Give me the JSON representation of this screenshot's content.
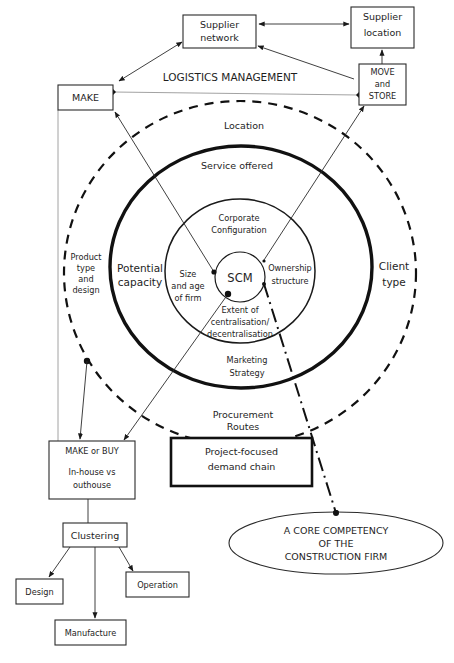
{
  "diagram": {
    "header_label": "LOGISTICS MANAGEMENT",
    "boxes": {
      "supplier_network": [
        "Supplier",
        "network"
      ],
      "supplier_location": [
        "Supplier",
        "location"
      ],
      "make": "MAKE",
      "move_and_store": [
        "MOVE",
        "and",
        "STORE"
      ],
      "make_or_buy": {
        "title": "MAKE or BUY",
        "lines": [
          "In-house vs",
          "outhouse"
        ]
      },
      "project_focused": [
        "Project-focused",
        "demand chain"
      ],
      "clustering": "Clustering",
      "design": "Design",
      "operation": "Operation",
      "manufacture": "Manufacture"
    },
    "rings": {
      "outer_dashed": {
        "top": "Location",
        "left": [
          "Product",
          "type",
          "and",
          "design"
        ],
        "right": [
          "Client",
          "type"
        ],
        "bottom": [
          "Procurement",
          "Routes"
        ]
      },
      "thick": {
        "top": "Service offered",
        "left": [
          "Potential",
          "capacity"
        ],
        "bottom": [
          "Marketing",
          "Strategy"
        ]
      },
      "middle": {
        "top": [
          "Corporate",
          "Configuration"
        ],
        "left": [
          "Size",
          "and age",
          "of firm"
        ],
        "right": [
          "Ownership",
          "structure"
        ],
        "bottom": [
          "Extent of",
          "centralisation/",
          "decentralisation"
        ]
      },
      "core": "SCM"
    },
    "ellipse": [
      "A CORE COMPETENCY",
      "OF THE",
      "CONSTRUCTION FIRM"
    ]
  }
}
